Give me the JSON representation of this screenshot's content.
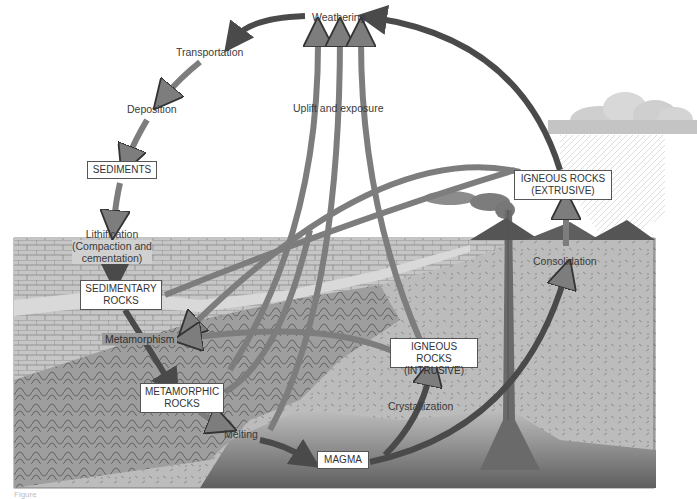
{
  "diagram": {
    "processes": {
      "weathering": "Weathering",
      "transportation": "Transportation",
      "deposition": "Deposition",
      "lithification_line1": "Lithification",
      "lithification_line2": "(Compaction and",
      "lithification_line3": "cementation)",
      "uplift": "Uplift and exposure",
      "metamorphism": "Metamorphism",
      "melting": "Melting",
      "crystallization": "Crystallization",
      "consolidation": "Consolidation"
    },
    "rock_types": {
      "sediments": "SEDIMENTS",
      "sedimentary_line1": "SEDIMENTARY",
      "sedimentary_line2": "ROCKS",
      "metamorphic_line1": "METAMORPHIC",
      "metamorphic_line2": "ROCKS",
      "igneous_intrusive_line1": "IGNEOUS ROCKS",
      "igneous_intrusive_line2": "(INTRUSIVE)",
      "igneous_extrusive_line1": "IGNEOUS ROCKS",
      "igneous_extrusive_line2": "(EXTRUSIVE)",
      "magma": "MAGMA"
    },
    "caption": "Figure",
    "colors": {
      "arrow_dark": "#4a4a4a",
      "arrow_mid": "#7d7d7d",
      "ground": "#b8b8b8",
      "magma": "#6b6b6b",
      "volcano": "#5a5a5a",
      "cloud": "#cfcfcf"
    }
  }
}
